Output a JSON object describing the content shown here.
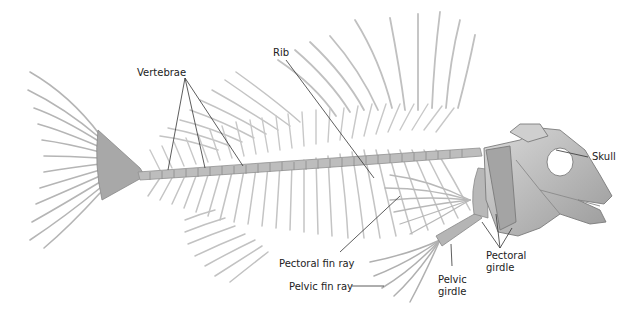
{
  "figure": {
    "labels": {
      "vertebrae": "Vertebrae",
      "rib": "Rib",
      "skull": "Skull",
      "pectoral_fin_ray": "Pectoral fin ray",
      "pectoral_girdle_1": "Pectoral",
      "pectoral_girdle_2": "girdle",
      "pelvic_girdle_1": "Pelvic",
      "pelvic_girdle_2": "girdle",
      "pelvic_fin_ray": "Pelvic fin ray"
    },
    "colors": {
      "background": "#ffffff",
      "bone": "#bdbdbd",
      "bone_dark": "#8f8f8f",
      "leader_line": "#333333",
      "text": "#222222"
    }
  }
}
